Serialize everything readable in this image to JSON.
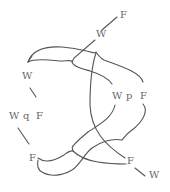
{
  "diagram": {
    "type": "string-diagram",
    "stroke_color": "#555555",
    "label_color": "#666666",
    "labels": [
      {
        "id": "top-f",
        "text": "F",
        "x": 120,
        "y": 18
      },
      {
        "id": "top-w",
        "text": "W",
        "x": 96,
        "y": 37
      },
      {
        "id": "left-w",
        "text": "W",
        "x": 22,
        "y": 79
      },
      {
        "id": "mid-w",
        "text": "W",
        "x": 112,
        "y": 99
      },
      {
        "id": "mid-p",
        "text": "p",
        "x": 126,
        "y": 99
      },
      {
        "id": "mid-f",
        "text": "F",
        "x": 140,
        "y": 99
      },
      {
        "id": "wqf-w",
        "text": "W",
        "x": 9,
        "y": 119
      },
      {
        "id": "wqf-q",
        "text": "q",
        "x": 23,
        "y": 119
      },
      {
        "id": "wqf-f",
        "text": "F",
        "x": 36,
        "y": 119
      },
      {
        "id": "low-f",
        "text": "F",
        "x": 29,
        "y": 161
      },
      {
        "id": "right-f",
        "text": "F",
        "x": 127,
        "y": 164
      },
      {
        "id": "bottom-w",
        "text": "W",
        "x": 149,
        "y": 178
      }
    ]
  }
}
